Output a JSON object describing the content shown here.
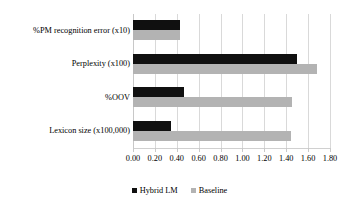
{
  "chart_data": {
    "type": "bar",
    "orientation": "horizontal",
    "title": "",
    "xlabel": "",
    "ylabel": "",
    "categories": [
      "%PM recognition error (x10)",
      "Perplexity (x100)",
      "%OOV",
      "Lexicon size (x100,000)"
    ],
    "series": [
      {
        "name": "Hybrid LM",
        "color": "#101010",
        "values": [
          0.43,
          1.5,
          0.47,
          0.35
        ]
      },
      {
        "name": "Baseline",
        "color": "#b3b3b3",
        "values": [
          0.43,
          1.68,
          1.45,
          1.44
        ]
      }
    ],
    "xlim": [
      0.0,
      1.8
    ],
    "xticks": [
      0.0,
      0.2,
      0.4,
      0.6,
      0.8,
      1.0,
      1.2,
      1.4,
      1.6,
      1.8
    ],
    "xtick_labels": [
      "0.00",
      "0.20",
      "0.40",
      "0.60",
      "0.80",
      "1.00",
      "1.20",
      "1.40",
      "1.60",
      "1.80"
    ],
    "grid": true,
    "grid_axis": "x",
    "legend_position": "bottom",
    "background": "#ffffff"
  }
}
